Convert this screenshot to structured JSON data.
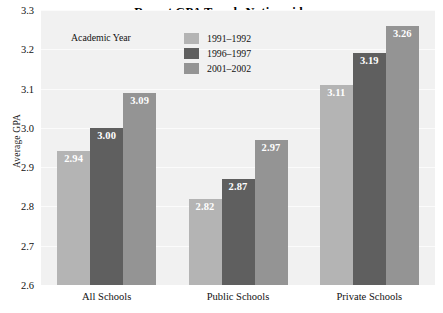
{
  "chart_data": {
    "type": "bar",
    "title": "Recent GPA Trends Nationwide",
    "xlabel": "",
    "ylabel": "Average GPA",
    "categories": [
      "All Schools",
      "Public Schools",
      "Private Schools"
    ],
    "series": [
      {
        "name": "1991–1992",
        "color": "#b4b4b4",
        "values": [
          2.94,
          2.82,
          3.11
        ]
      },
      {
        "name": "1996–1997",
        "color": "#5f5f5f",
        "values": [
          3.0,
          2.87,
          3.19
        ]
      },
      {
        "name": "2001–2002",
        "color": "#949494",
        "values": [
          3.09,
          2.97,
          3.26
        ]
      }
    ],
    "value_labels": [
      [
        "2.94",
        "3.00",
        "3.09"
      ],
      [
        "2.82",
        "2.87",
        "2.97"
      ],
      [
        "3.11",
        "3.19",
        "3.26"
      ]
    ],
    "ylim": [
      2.6,
      3.3
    ],
    "yticks": [
      "2.6",
      "2.7",
      "2.8",
      "2.9",
      "3.0",
      "3.1",
      "3.2",
      "3.3"
    ],
    "ytick_values": [
      2.6,
      2.7,
      2.8,
      2.9,
      3.0,
      3.1,
      3.2,
      3.3
    ],
    "grid": true,
    "legend_title": "Academic Year",
    "legend_position": "top-left-inside",
    "plot_background": "#f1f1f1",
    "gridline_color": "#fbfbfb",
    "value_label_color": "#ffffff"
  }
}
